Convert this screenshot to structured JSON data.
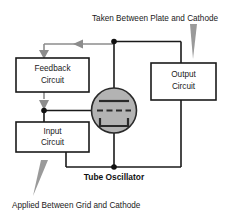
{
  "diagram": {
    "caption": "Tube Oscillator",
    "colors": {
      "wire": "#1a1a1a",
      "box_stroke": "#1a1a1a",
      "box_fill": "#ffffff",
      "feedback_arrow": "#8c8c8c",
      "callout_wedge": "#9a9a9a",
      "tube_fill": "#b3b3b3",
      "tube_stroke": "#2a2a2a",
      "junction_dot": "#111111",
      "background": "#ffffff",
      "text": "#1a1a1a"
    },
    "blocks": [
      {
        "id": "feedback",
        "line1": "Feedback",
        "line2": "Circuit"
      },
      {
        "id": "output",
        "line1": "Output",
        "line2": "Circuit"
      },
      {
        "id": "input",
        "line1": "Input",
        "line2": "Circuit"
      }
    ],
    "callouts": [
      {
        "id": "top",
        "text": "Taken Between Plate and Cathode"
      },
      {
        "id": "bottom",
        "text": "Applied Between Grid and Cathode"
      }
    ],
    "tube": {
      "name": "vacuum-tube-symbol",
      "elements": [
        "plate",
        "grid",
        "cathode"
      ]
    }
  }
}
